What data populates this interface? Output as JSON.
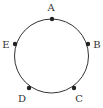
{
  "diagram": {
    "type": "circle-with-points",
    "circle": {
      "cx": 51.5,
      "cy": 56,
      "r": 37,
      "stroke": "#333333"
    },
    "points": [
      {
        "label": "A",
        "x": 52,
        "y": 19,
        "lx": 51,
        "ly": 11
      },
      {
        "label": "B",
        "x": 88,
        "y": 44,
        "lx": 97,
        "ly": 47.5
      },
      {
        "label": "C",
        "x": 74,
        "y": 88,
        "lx": 79,
        "ly": 102
      },
      {
        "label": "D",
        "x": 29,
        "y": 88,
        "lx": 22,
        "ly": 102
      },
      {
        "label": "E",
        "x": 15,
        "y": 44,
        "lx": 6,
        "ly": 47.5
      }
    ],
    "point_color": "#222222"
  }
}
